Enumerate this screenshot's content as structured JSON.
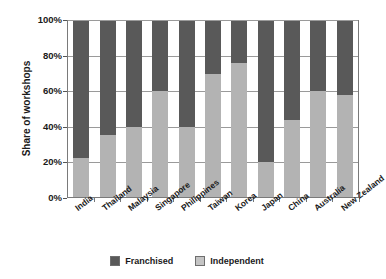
{
  "chart_data": {
    "type": "bar",
    "subtype": "stacked-100-percent",
    "title": "",
    "xlabel": "",
    "ylabel": "Share of workshops",
    "ylim": [
      0,
      100
    ],
    "ytick_labels": [
      "0%",
      "20%",
      "40%",
      "60%",
      "80%",
      "100%"
    ],
    "ytick_values": [
      0,
      20,
      40,
      60,
      80,
      100
    ],
    "grid": true,
    "legend_position": "bottom",
    "categories": [
      "India",
      "Thailand",
      "Malaysia",
      "Singapore",
      "Philippines",
      "Taiwan",
      "Korea",
      "Japan",
      "China",
      "Australia",
      "New Zealand"
    ],
    "series": [
      {
        "name": "Independent",
        "color": "#b3b3b3",
        "values": [
          22,
          35,
          40,
          60,
          40,
          70,
          76,
          20,
          44,
          60,
          58
        ]
      },
      {
        "name": "Franchised",
        "color": "#595959",
        "values": [
          78,
          65,
          60,
          40,
          60,
          30,
          24,
          80,
          56,
          40,
          42
        ]
      }
    ]
  },
  "legend": {
    "items": [
      {
        "label": "Franchised",
        "color": "#595959"
      },
      {
        "label": "Independent",
        "color": "#c4c4c4"
      }
    ]
  },
  "colors": {
    "franchised": "#595959",
    "independent": "#b3b3b3",
    "axis": "#7a7a7a",
    "grid": "#9a9a9a",
    "text": "#1a1a1a",
    "background": "#ffffff"
  }
}
